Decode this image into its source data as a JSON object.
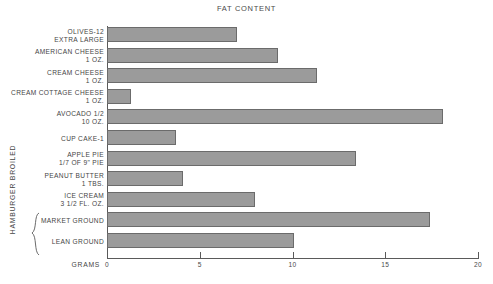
{
  "chart_data": {
    "type": "bar",
    "orientation": "horizontal",
    "title": "FAT CONTENT",
    "xlabel": "GRAMS",
    "ylabel": "",
    "xlim": [
      0,
      20
    ],
    "xticks": [
      0,
      5,
      10,
      15,
      20
    ],
    "xtick_labels": [
      "0",
      "5",
      "10",
      "15",
      "20"
    ],
    "grid": false,
    "legend": false,
    "bar_color": "#9b9b9b",
    "bar_edge_color": "#6b6b6b",
    "axis_color": "#5a5a5a",
    "categories": [
      "OLIVES-12 EXTRA LARGE",
      "AMERICAN CHEESE 1 OZ.",
      "CREAM CHEESE 1 OZ.",
      "CREAM COTTAGE CHEESE 1 OZ.",
      "AVOCADO 1/2 10 OZ.",
      "CUP CAKE-1",
      "APPLE PIE 1/7 OF 9\" PIE",
      "PEANUT BUTTER 1 TBS.",
      "ICE CREAM 3 1/2 FL. OZ.",
      "MARKET GROUND",
      "LEAN GROUND"
    ],
    "values": [
      7.0,
      9.2,
      11.3,
      1.3,
      18.1,
      3.7,
      13.4,
      4.1,
      8.0,
      17.4,
      10.1
    ],
    "group_annotation": {
      "label": "HAMBURGER BROILED",
      "covers": [
        "MARKET GROUND",
        "LEAN GROUND"
      ]
    }
  },
  "rows": [
    {
      "line1": "OLIVES-12",
      "line2": "EXTRA LARGE",
      "value": 7.0
    },
    {
      "line1": "AMERICAN CHEESE",
      "line2": "1 OZ.",
      "value": 9.2
    },
    {
      "line1": "CREAM CHEESE",
      "line2": "1 OZ.",
      "value": 11.3
    },
    {
      "line1": "CREAM COTTAGE CHEESE",
      "line2": "1 OZ.",
      "value": 1.3
    },
    {
      "line1": "AVOCADO 1/2",
      "line2": "10 OZ.",
      "value": 18.1
    },
    {
      "line1": "CUP CAKE-1",
      "line2": "",
      "value": 3.7
    },
    {
      "line1": "APPLE PIE",
      "line2": "1/7 OF 9\" PIE",
      "value": 13.4
    },
    {
      "line1": "PEANUT BUTTER",
      "line2": "1 TBS.",
      "value": 4.1
    },
    {
      "line1": "ICE CREAM",
      "line2": "3 1/2 FL. OZ.",
      "value": 8.0
    },
    {
      "line1": "MARKET GROUND",
      "line2": "",
      "value": 17.4
    },
    {
      "line1": "LEAN GROUND",
      "line2": "",
      "value": 10.1
    }
  ],
  "axis": {
    "x_title": "GRAMS",
    "ticks": [
      "0",
      "5",
      "10",
      "15",
      "20"
    ]
  },
  "group": {
    "label": "HAMBURGER BROILED"
  }
}
